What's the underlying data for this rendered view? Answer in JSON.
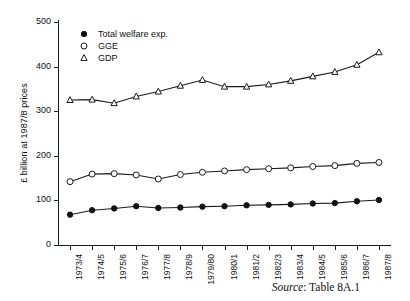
{
  "chart_data": {
    "type": "line",
    "title": "",
    "xlabel": "",
    "ylabel": "£ billion at 1987/8 prices",
    "ylim": [
      0,
      500
    ],
    "yticks": [
      0,
      100,
      200,
      300,
      400,
      500
    ],
    "grid": false,
    "legend_position": "top-left-inside",
    "categories": [
      "1973/4",
      "1974/5",
      "1975/6",
      "1976/7",
      "1977/8",
      "1978/9",
      "1979/80",
      "1980/1",
      "1981/2",
      "1982/3",
      "1983/4",
      "1984/5",
      "1985/6",
      "1986/7",
      "1987/8"
    ],
    "series": [
      {
        "name": "Total welfare exp.",
        "marker": "filled-circle",
        "values": [
          68,
          78,
          82,
          87,
          83,
          84,
          86,
          87,
          89,
          90,
          91,
          93,
          94,
          98,
          101
        ]
      },
      {
        "name": "GGE",
        "marker": "open-circle",
        "values": [
          142,
          159,
          160,
          157,
          148,
          158,
          163,
          166,
          169,
          171,
          173,
          176,
          178,
          183,
          185
        ]
      },
      {
        "name": "GDP",
        "marker": "open-triangle",
        "values": [
          325,
          326,
          318,
          333,
          344,
          357,
          370,
          355,
          355,
          360,
          368,
          378,
          388,
          404,
          432
        ]
      }
    ]
  },
  "legend": {
    "entries": [
      {
        "label": "Total welfare exp.",
        "marker": "filled-circle"
      },
      {
        "label": "GGE",
        "marker": "open-circle"
      },
      {
        "label": "GDP",
        "marker": "open-triangle"
      }
    ]
  },
  "caption": {
    "source_word": "Source",
    "separator": ": ",
    "reference": "Table 8A.1"
  }
}
